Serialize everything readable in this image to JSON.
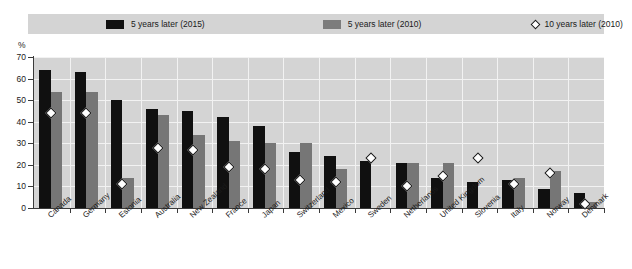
{
  "chart_data": {
    "type": "bar",
    "title": "",
    "subtitle": "",
    "xlabel": "",
    "ylabel": "%",
    "ylim": [
      0,
      70
    ],
    "ytick_values": [
      0,
      10,
      20,
      30,
      40,
      50,
      60,
      70
    ],
    "ytick_labels": [
      "0",
      "10",
      "20",
      "30",
      "40",
      "50",
      "60",
      "70"
    ],
    "grid": true,
    "legend_position": "top",
    "categories": [
      "Canada",
      "Germany",
      "Estonia",
      "Australia",
      "New Zealand",
      "France",
      "Japan",
      "Switzerland",
      "Mexico",
      "Sweden",
      "Netherlands",
      "United Kingdom",
      "Slovenia",
      "Italy",
      "Norway",
      "Denmark"
    ],
    "series": [
      {
        "name": "5 years later (2015)",
        "type": "bar",
        "color": "#101010",
        "values": [
          64,
          63,
          50,
          46,
          45,
          42,
          38,
          26,
          24,
          22,
          21,
          14,
          12,
          13,
          9,
          7
        ]
      },
      {
        "name": "5 years later (2010)",
        "type": "bar",
        "color": "#767676",
        "values": [
          54,
          54,
          14,
          43,
          34,
          31,
          30,
          30,
          18,
          0,
          21,
          21,
          0,
          14,
          17,
          3
        ]
      },
      {
        "name": "10 years later (2010)",
        "type": "scatter",
        "marker": "diamond",
        "color": "#ffffff",
        "values": [
          44,
          44,
          11,
          28,
          27,
          19,
          18,
          13,
          12,
          23,
          10,
          15,
          23,
          11,
          16,
          2
        ]
      }
    ]
  },
  "legend": {
    "items": [
      {
        "label": "5 years later (2015)",
        "swatch": "black-square-icon"
      },
      {
        "label": "5 years later (2010)",
        "swatch": "grey-square-icon"
      },
      {
        "label": "10 years later (2010)",
        "swatch": "diamond-marker-icon"
      }
    ]
  },
  "axis": {
    "unit_label": "%"
  }
}
